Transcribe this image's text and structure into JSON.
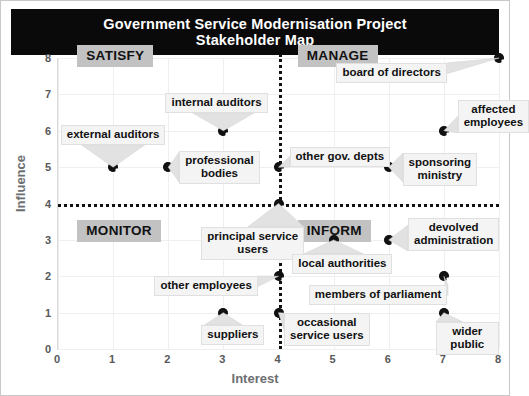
{
  "title": {
    "line1": "Government Service Modernisation Project",
    "line2": "Stakeholder Map"
  },
  "chart_data": {
    "type": "scatter",
    "title": "Government Service Modernisation Project Stakeholder Map",
    "xlabel": "Interest",
    "ylabel": "Influence",
    "xlim": [
      0,
      8
    ],
    "ylim": [
      0,
      8
    ],
    "xticks": [
      "0",
      "1",
      "2",
      "3",
      "4",
      "5",
      "6",
      "7",
      "8"
    ],
    "yticks": [
      "0",
      "1",
      "2",
      "3",
      "4",
      "5",
      "6",
      "7",
      "8"
    ],
    "grid": true,
    "legend": "none",
    "quadrant_divider_x": 4,
    "quadrant_divider_y": 4,
    "quadrants": [
      {
        "name": "SATISFY",
        "x": 0.35,
        "y": 8.35
      },
      {
        "name": "MANAGE",
        "x": 4.35,
        "y": 8.35
      },
      {
        "name": "MONITOR",
        "x": 0.35,
        "y": 3.55
      },
      {
        "name": "INFORM",
        "x": 4.35,
        "y": 3.55
      }
    ],
    "points": [
      {
        "label": "external auditors",
        "x": 1,
        "y": 5,
        "label_x": 0.05,
        "label_y": 6.15,
        "label_align": "center"
      },
      {
        "label": "professional\nbodies",
        "x": 2,
        "y": 5,
        "label_x": 2.2,
        "label_y": 5.45,
        "label_align": "center"
      },
      {
        "label": "internal auditors",
        "x": 3,
        "y": 6,
        "label_x": 1.95,
        "label_y": 7.05,
        "label_align": "center"
      },
      {
        "label": "other gov. depts",
        "x": 4,
        "y": 5,
        "label_x": 4.2,
        "label_y": 5.55,
        "label_align": "center"
      },
      {
        "label": "sponsoring\nministry",
        "x": 6,
        "y": 5,
        "label_x": 6.25,
        "label_y": 5.4,
        "label_align": "center"
      },
      {
        "label": "board of directors",
        "x": 8,
        "y": 8,
        "label_x": 5.05,
        "label_y": 7.85,
        "label_align": "center"
      },
      {
        "label": "affected\nemployees",
        "x": 7,
        "y": 6,
        "label_x": 7.25,
        "label_y": 6.85,
        "label_align": "center"
      },
      {
        "label": "principal service\nusers",
        "x": 4,
        "y": 4,
        "label_x": 2.6,
        "label_y": 3.35,
        "label_align": "center"
      },
      {
        "label": "devolved\nadministration",
        "x": 6,
        "y": 3,
        "label_x": 6.35,
        "label_y": 3.6,
        "label_align": "center"
      },
      {
        "label": "local authorities",
        "x": 5,
        "y": 3,
        "label_x": 4.25,
        "label_y": 2.6,
        "label_align": "center"
      },
      {
        "label": "other employees",
        "x": 4,
        "y": 2,
        "label_x": 1.75,
        "label_y": 2.0,
        "label_align": "center"
      },
      {
        "label": "members of parliament",
        "x": 7,
        "y": 2,
        "label_x": 4.55,
        "label_y": 1.75,
        "label_align": "center"
      },
      {
        "label": "suppliers",
        "x": 3,
        "y": 1,
        "label_x": 2.6,
        "label_y": 0.65,
        "label_align": "center"
      },
      {
        "label": "occasional\nservice users",
        "x": 4,
        "y": 1,
        "label_x": 4.1,
        "label_y": 1.0,
        "label_align": "center"
      },
      {
        "label": "wider public",
        "x": 7,
        "y": 1,
        "label_x": 6.85,
        "label_y": 0.75,
        "label_align": "center"
      }
    ]
  },
  "colors": {
    "banner_background": "#0a0a0a",
    "banner_text": "#ffffff",
    "quadrant_background": "#c2c2c2",
    "marker": "#111111",
    "callout_background": "#f4f4f4",
    "axis_text": "#58585a",
    "axis_title": "#6d6e71",
    "grid": "#efefef"
  }
}
